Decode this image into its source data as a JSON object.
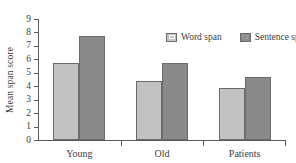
{
  "chart_data": {
    "type": "bar",
    "title": "",
    "subtitle": "",
    "xlabel": "",
    "ylabel": "Mean span score",
    "categories": [
      "Young",
      "Old",
      "Patients"
    ],
    "series": [
      {
        "name": "Word span",
        "color": "#c2c2c2",
        "values": [
          5.7,
          4.4,
          3.85
        ]
      },
      {
        "name": "Sentence span",
        "color": "#8a8a8a",
        "values": [
          7.7,
          5.75,
          4.65
        ]
      }
    ],
    "ylim": [
      0,
      9
    ],
    "ytick_labels": [
      "0",
      "1",
      "2",
      "3",
      "4",
      "5",
      "6",
      "7",
      "8",
      "9"
    ],
    "ytick_values": [
      0,
      1,
      2,
      3,
      4,
      5,
      6,
      7,
      8,
      9
    ],
    "grid": false,
    "legend_position": "top-right",
    "legend_entries": [
      "Word span",
      "Sentence span"
    ],
    "annotations": [],
    "axis_color": "#5a5a5a",
    "bar_border_color": "#6b6b6b",
    "background": "#ffffff"
  }
}
